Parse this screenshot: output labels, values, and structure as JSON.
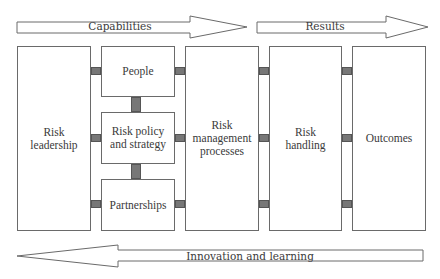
{
  "diagram": {
    "arrows": {
      "capabilities": {
        "label": "Capabilities",
        "direction": "right"
      },
      "results": {
        "label": "Results",
        "direction": "right"
      },
      "innovation": {
        "label": "Innovation and learning",
        "direction": "left"
      }
    },
    "boxes": {
      "risk_leadership": "Risk\nleadership",
      "people": "People",
      "risk_policy": "Risk policy\nand strategy",
      "partnerships": "Partnerships",
      "risk_management": "Risk\nmanagement\nprocesses",
      "risk_handling": "Risk\nhandling",
      "outcomes": "Outcomes"
    },
    "colors": {
      "border": "#6a6a6a",
      "connector": "#777777",
      "text": "#3a3a3a"
    }
  }
}
